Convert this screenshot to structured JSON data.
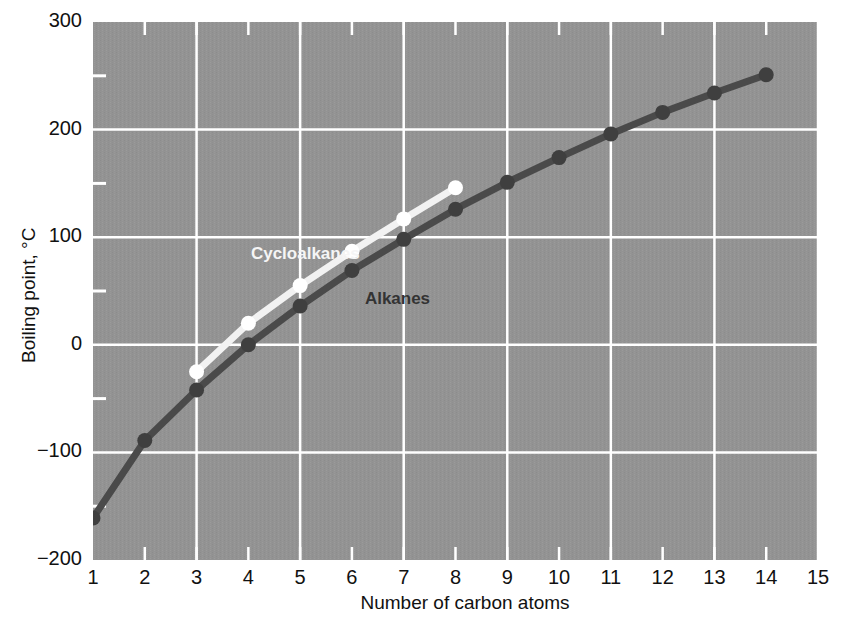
{
  "chart_data": {
    "type": "line",
    "title": "",
    "xlabel": "Number of carbon atoms",
    "ylabel": "Boiling point, °C",
    "xlim": [
      1,
      15
    ],
    "ylim": [
      -200,
      300
    ],
    "xticks": [
      "1",
      "2",
      "3",
      "4",
      "5",
      "6",
      "7",
      "8",
      "9",
      "10",
      "11",
      "12",
      "13",
      "14",
      "15"
    ],
    "yticks": [
      "300",
      "200",
      "100",
      "0",
      "-100",
      "-200"
    ],
    "y_minor_ticks": [
      250,
      150,
      50,
      -50,
      -150
    ],
    "x_major_gridlines": [
      3,
      5,
      7,
      9,
      11,
      13,
      15
    ],
    "grid": true,
    "grid_color": "#ffffff",
    "plot_background": "#939393",
    "legend_position": "inline-annotations",
    "series": [
      {
        "name": "Alkanes",
        "color": "#4a4a4a",
        "marker_color": "#3f3f3f",
        "label_color": "#333333",
        "x": [
          1,
          2,
          3,
          4,
          5,
          6,
          7,
          8,
          9,
          10,
          11,
          12,
          13,
          14
        ],
        "values": [
          -161,
          -89,
          -42,
          0,
          36,
          69,
          98,
          126,
          151,
          174,
          196,
          216,
          234,
          251
        ]
      },
      {
        "name": "Cycloalkanes",
        "color": "#f2f2f2",
        "marker_color": "#ffffff",
        "label_color": "#f5f5f5",
        "x": [
          3,
          4,
          5,
          6,
          7,
          8
        ],
        "values": [
          -25,
          20,
          55,
          87,
          117,
          146
        ]
      }
    ],
    "annotations": [
      {
        "text": "Cycloalkanes",
        "x": 4.05,
        "y": 83,
        "color": "#f5f5f5"
      },
      {
        "text": "Alkanes",
        "x": 6.25,
        "y": 42,
        "color": "#333333"
      }
    ]
  }
}
